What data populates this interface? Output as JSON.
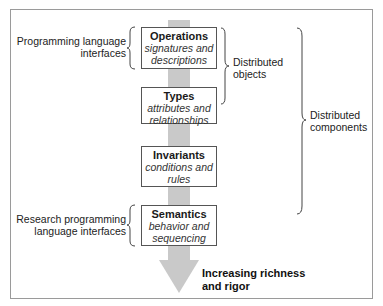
{
  "diagram": {
    "levels": [
      {
        "title": "Operations",
        "subtitle_line1": "signatures and",
        "subtitle_line2": "descriptions"
      },
      {
        "title": "Types",
        "subtitle_line1": "attributes and",
        "subtitle_line2": "relationships"
      },
      {
        "title": "Invariants",
        "subtitle_line1": "conditions and",
        "subtitle_line2": "rules"
      },
      {
        "title": "Semantics",
        "subtitle_line1": "behavior and",
        "subtitle_line2": "sequencing"
      }
    ],
    "left_labels": {
      "programming": {
        "line1": "Programming language",
        "line2": "interfaces"
      },
      "research": {
        "line1": "Research programming",
        "line2": "language interfaces"
      }
    },
    "right_labels": {
      "objects": {
        "line1": "Distributed",
        "line2": "objects"
      },
      "components": {
        "line1": "Distributed",
        "line2": "components"
      }
    },
    "arrow_label": {
      "line1": "Increasing richness",
      "line2": "and rigor"
    },
    "colors": {
      "arrow": "#c9c9c9",
      "box_border": "#555555",
      "frame": "#9a9a9a"
    }
  }
}
